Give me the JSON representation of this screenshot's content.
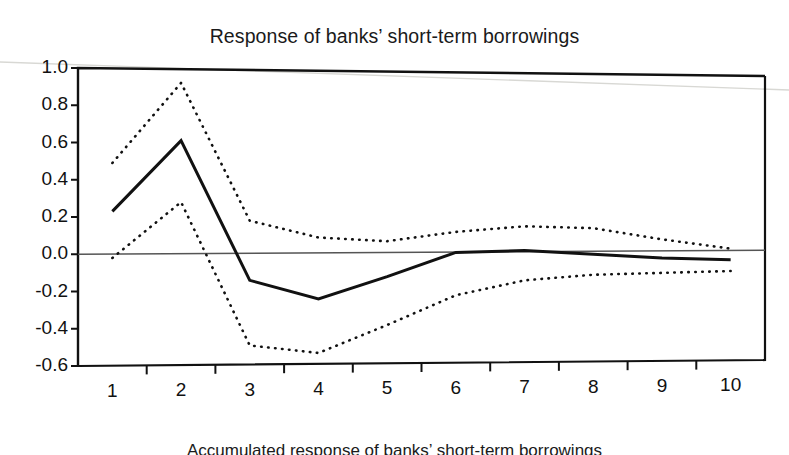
{
  "chart_data": {
    "type": "line",
    "title": "Response of banks’ short-term borrowings",
    "caption": "Accumulated response of banks’ short-term borrowings",
    "xlabel": "",
    "ylabel": "",
    "xlim": [
      0.5,
      10.5
    ],
    "ylim": [
      -0.6,
      1.0
    ],
    "grid": false,
    "legend": "none",
    "zero_line": 0.0,
    "x": [
      1,
      2,
      3,
      4,
      5,
      6,
      7,
      8,
      9,
      10
    ],
    "xtick_labels": [
      "1",
      "2",
      "3",
      "4",
      "5",
      "6",
      "7",
      "8",
      "9",
      "10"
    ],
    "ytick_labels": [
      "1.0",
      "0.8",
      "0.6",
      "0.4",
      "0.2",
      "0.0",
      "-0.2",
      "-0.4",
      "-0.6"
    ],
    "ytick_values": [
      1.0,
      0.8,
      0.6,
      0.4,
      0.2,
      0.0,
      -0.2,
      -0.4,
      -0.6
    ],
    "series": [
      {
        "name": "Point estimate",
        "style": "solid",
        "color": "#111111",
        "width": 3.0,
        "values": [
          0.23,
          0.61,
          -0.14,
          -0.24,
          -0.12,
          0.01,
          0.02,
          0.0,
          -0.02,
          -0.03
        ]
      },
      {
        "name": "Upper confidence band",
        "style": "dotted",
        "color": "#111111",
        "width": 2.6,
        "values": [
          0.49,
          0.92,
          0.18,
          0.09,
          0.07,
          0.12,
          0.15,
          0.14,
          0.08,
          0.03
        ]
      },
      {
        "name": "Lower confidence band",
        "style": "dotted",
        "color": "#111111",
        "width": 2.6,
        "values": [
          -0.02,
          0.28,
          -0.49,
          -0.53,
          -0.38,
          -0.22,
          -0.14,
          -0.11,
          -0.1,
          -0.09
        ]
      }
    ]
  },
  "axes": {
    "frame_color": "#111111",
    "zero_line_color": "#555555"
  }
}
